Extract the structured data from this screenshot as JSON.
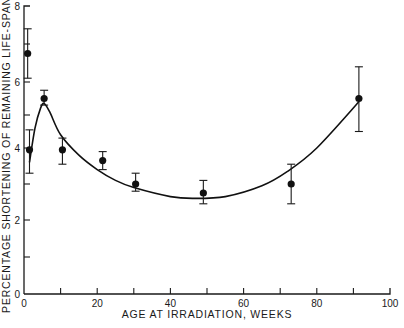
{
  "chart_data": {
    "type": "scatter",
    "title": "",
    "xlabel": "AGE AT IRRADIATION, WEEKS",
    "ylabel": "PERCENTAGE SHORTENING OF REMAINING LIFE-SPAN",
    "xlim": [
      0,
      100
    ],
    "ylim": [
      0,
      8
    ],
    "grid": false,
    "legend": null,
    "x_ticks_major": [
      0,
      20,
      40,
      60,
      80,
      100
    ],
    "x_ticks_minor": [
      10,
      30,
      50,
      70,
      90
    ],
    "y_ticks_major": [
      0,
      2,
      4,
      6,
      8
    ],
    "y_ticks_minor": [
      1,
      3,
      5,
      7
    ],
    "x_tick_labels": [
      "0",
      "20",
      "40",
      "60",
      "80",
      "100"
    ],
    "y_tick_labels": [
      "0",
      "2",
      "4",
      "6",
      "8"
    ],
    "series": [
      {
        "name": "Observed",
        "kind": "points_with_error_bars",
        "points": [
          {
            "x": 1.0,
            "y": 6.75,
            "y_low": 6.1,
            "y_high": 7.4
          },
          {
            "x": 1.5,
            "y": 3.95,
            "y_low": 3.3,
            "y_high": 4.55
          },
          {
            "x": 5.5,
            "y": 5.5,
            "y_low": 5.3,
            "y_high": 5.75
          },
          {
            "x": 10.5,
            "y": 3.95,
            "y_low": 3.55,
            "y_high": 4.3
          },
          {
            "x": 21.5,
            "y": 3.65,
            "y_low": 3.4,
            "y_high": 3.9
          },
          {
            "x": 30.5,
            "y": 3.0,
            "y_low": 2.8,
            "y_high": 3.3
          },
          {
            "x": 49.0,
            "y": 2.75,
            "y_low": 2.45,
            "y_high": 3.1
          },
          {
            "x": 73.0,
            "y": 3.0,
            "y_low": 2.45,
            "y_high": 3.55
          },
          {
            "x": 91.5,
            "y": 5.5,
            "y_low": 4.5,
            "y_high": 6.4
          }
        ]
      },
      {
        "name": "Fitted curve",
        "kind": "line",
        "points": [
          {
            "x": 1.5,
            "y": 3.6
          },
          {
            "x": 3.0,
            "y": 4.6
          },
          {
            "x": 4.5,
            "y": 5.2
          },
          {
            "x": 5.5,
            "y": 5.35
          },
          {
            "x": 7.0,
            "y": 5.1
          },
          {
            "x": 10.0,
            "y": 4.4
          },
          {
            "x": 15.0,
            "y": 3.8
          },
          {
            "x": 20.0,
            "y": 3.4
          },
          {
            "x": 25.0,
            "y": 3.1
          },
          {
            "x": 30.0,
            "y": 2.9
          },
          {
            "x": 40.0,
            "y": 2.65
          },
          {
            "x": 46.0,
            "y": 2.6
          },
          {
            "x": 55.0,
            "y": 2.65
          },
          {
            "x": 65.0,
            "y": 2.95
          },
          {
            "x": 72.0,
            "y": 3.35
          },
          {
            "x": 80.0,
            "y": 4.0
          },
          {
            "x": 91.5,
            "y": 5.4
          }
        ]
      }
    ]
  },
  "layout": {
    "x_px": {
      "0": 24,
      "100": 390
    },
    "y_px_anchors": [
      [
        0,
        294
      ],
      [
        2,
        220
      ],
      [
        4,
        148
      ],
      [
        6,
        82
      ],
      [
        8,
        6
      ]
    ]
  }
}
